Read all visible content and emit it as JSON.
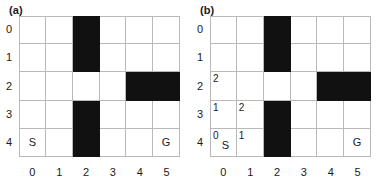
{
  "figure": {
    "grid": {
      "cols": 6,
      "rows": 5
    },
    "col_labels": [
      "0",
      "1",
      "2",
      "3",
      "4",
      "5"
    ],
    "row_labels": [
      "0",
      "1",
      "2",
      "3",
      "4"
    ]
  },
  "panels": [
    {
      "label": "(a)",
      "obstacles": [
        {
          "row": 0,
          "col": 2
        },
        {
          "row": 1,
          "col": 2
        },
        {
          "row": 2,
          "col": 4
        },
        {
          "row": 2,
          "col": 5
        },
        {
          "row": 3,
          "col": 2
        },
        {
          "row": 4,
          "col": 2
        }
      ],
      "markers": [
        {
          "row": 4,
          "col": 0,
          "text": "S"
        },
        {
          "row": 4,
          "col": 5,
          "text": "G"
        }
      ],
      "cell_values": []
    },
    {
      "label": "(b)",
      "obstacles": [
        {
          "row": 0,
          "col": 2
        },
        {
          "row": 1,
          "col": 2
        },
        {
          "row": 2,
          "col": 4
        },
        {
          "row": 2,
          "col": 5
        },
        {
          "row": 3,
          "col": 2
        },
        {
          "row": 4,
          "col": 2
        }
      ],
      "markers": [
        {
          "row": 4,
          "col": 0,
          "text": "S"
        },
        {
          "row": 4,
          "col": 5,
          "text": "G"
        }
      ],
      "cell_values": [
        {
          "row": 2,
          "col": 0,
          "text": "2"
        },
        {
          "row": 3,
          "col": 0,
          "text": "1"
        },
        {
          "row": 3,
          "col": 1,
          "text": "2"
        },
        {
          "row": 4,
          "col": 0,
          "text": "0"
        },
        {
          "row": 4,
          "col": 1,
          "text": "1"
        }
      ]
    }
  ],
  "colors": {
    "obstacle": "#111111",
    "gridline": "#b9b9b9",
    "text": "#1a1a1a",
    "background": "#ffffff"
  }
}
